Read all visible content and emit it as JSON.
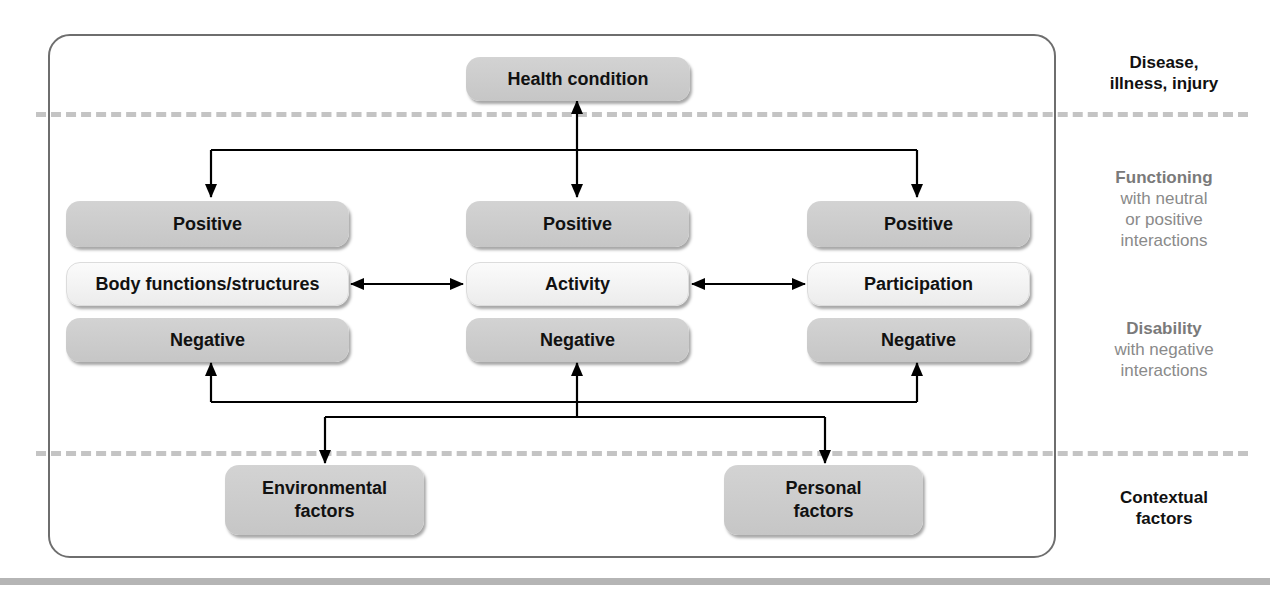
{
  "diagram": {
    "title_model": "ICF biopsychosocial model",
    "top_box": {
      "label": "Health condition"
    },
    "columns": [
      {
        "positive": "Positive",
        "label": "Body functions/structures",
        "negative": "Negative"
      },
      {
        "positive": "Positive",
        "label": "Activity",
        "negative": "Negative"
      },
      {
        "positive": "Positive",
        "label": "Participation",
        "negative": "Negative"
      }
    ],
    "bottom_boxes": [
      {
        "line1": "Environmental",
        "line2": "factors"
      },
      {
        "line1": "Personal",
        "line2": "factors"
      }
    ],
    "side_labels": {
      "disease": {
        "line1": "Disease,",
        "line2": "illness, injury"
      },
      "functioning": {
        "heading": "Functioning",
        "line1": "with neutral",
        "line2": "or positive",
        "line3": "interactions"
      },
      "disability": {
        "heading": "Disability",
        "line1": "with negative",
        "line2": "interactions"
      },
      "contextual": {
        "line1": "Contextual",
        "line2": "factors"
      }
    },
    "colors": {
      "box_fill": "#c9c9c9",
      "light_box_fill": "#f3f3f3",
      "frame": "#6e6e6e",
      "dash": "#c4c4c4",
      "side_gray": "#8a8a8a"
    }
  }
}
